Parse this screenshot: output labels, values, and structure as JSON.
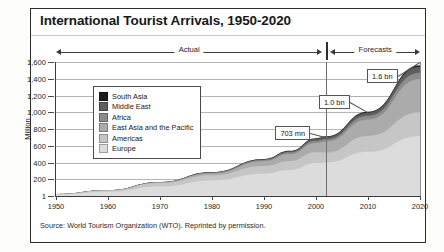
{
  "figure": {
    "title": "International Tourist Arrivals, 1950-2020",
    "source": "Source: World Tourism Organization (WTO). Reprinted by permission."
  },
  "bands": {
    "actual_label": "Actual",
    "forecast_label": "Forecasts"
  },
  "callouts": [
    {
      "name": "callout-703mn",
      "label": "703 mn"
    },
    {
      "name": "callout-1-0bn",
      "label": "1.0 bn"
    },
    {
      "name": "callout-1-6bn",
      "label": "1.6 bn"
    }
  ],
  "chart_data": {
    "type": "area",
    "stacked": true,
    "title": "International Tourist Arrivals, 1950-2020",
    "xlabel": "",
    "ylabel": "Million",
    "xlim": [
      1950,
      2020
    ],
    "ylim": [
      1,
      1600
    ],
    "grid": true,
    "legend_position": "inside-upper-left",
    "xticks": [
      1950,
      1960,
      1970,
      1980,
      1990,
      2000,
      2010,
      2020
    ],
    "xticklabels": [
      "1950",
      "1960",
      "1970",
      "1980",
      "1990",
      "2000",
      "2010",
      "2020"
    ],
    "yticks": [
      1,
      200,
      400,
      600,
      800,
      1000,
      1200,
      1400,
      1600
    ],
    "yticklabels": [
      "1",
      "200",
      "400",
      "600",
      "800",
      "1,000",
      "1,200",
      "1,400",
      "1,600"
    ],
    "forecast_start": 2002,
    "annotations": [
      {
        "text": "703 mn",
        "x": 2002,
        "y": 703
      },
      {
        "text": "1.0 bn",
        "x": 2010,
        "y": 1000
      },
      {
        "text": "1.6 bn",
        "x": 2020,
        "y": 1600
      }
    ],
    "x": [
      1950,
      1960,
      1970,
      1980,
      1990,
      1995,
      2000,
      2002,
      2010,
      2020
    ],
    "series": [
      {
        "name": "Europe",
        "color": "#dcdcdc",
        "values": [
          17,
          50,
          113,
          186,
          266,
          310,
          393,
          399,
          527,
          717
        ]
      },
      {
        "name": "Americas",
        "color": "#c6c6c6",
        "values": [
          6,
          17,
          43,
          62,
          93,
          109,
          128,
          120,
          190,
          282
        ]
      },
      {
        "name": "East Asia and the Pacific",
        "color": "#ababab",
        "values": [
          0.2,
          1,
          6,
          23,
          56,
          82,
          112,
          131,
          195,
          397
        ]
      },
      {
        "name": "Africa",
        "color": "#8c8c8c",
        "values": [
          0.5,
          1,
          3,
          7,
          15,
          20,
          27,
          29,
          47,
          77
        ]
      },
      {
        "name": "Middle East",
        "color": "#5e5e5e",
        "values": [
          0.2,
          1,
          2,
          7,
          10,
          14,
          24,
          28,
          36,
          69
        ]
      },
      {
        "name": "South Asia",
        "color": "#1c1c1c",
        "values": [
          0.2,
          0.5,
          1,
          2,
          3,
          4,
          6,
          6,
          11,
          19
        ]
      }
    ],
    "totals": [
      24,
      69,
      166,
      287,
      441,
      540,
      687,
      703,
      1006,
      1561
    ]
  }
}
